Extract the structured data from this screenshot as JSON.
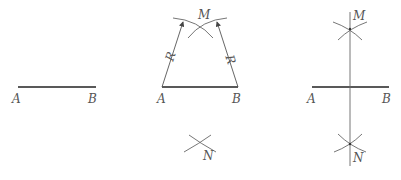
{
  "colors": {
    "segment": "#222222",
    "construction": "#666666",
    "label": "#555555",
    "background": "#ffffff"
  },
  "panels": [
    {
      "id": "given-segment",
      "labels": {
        "A": "A",
        "B": "B"
      }
    },
    {
      "id": "arc-construction",
      "labels": {
        "A": "A",
        "B": "B",
        "M": "M",
        "N": "N",
        "R_left": "R",
        "R_right": "R"
      }
    },
    {
      "id": "perpendicular-bisector",
      "labels": {
        "A": "A",
        "B": "B",
        "M": "M",
        "N": "N"
      }
    }
  ]
}
